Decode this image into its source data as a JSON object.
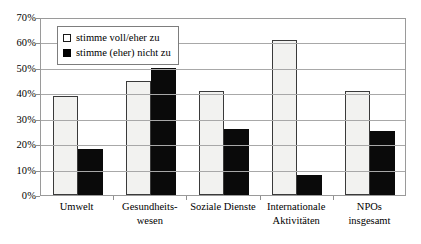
{
  "chart_data": {
    "type": "bar",
    "title": "",
    "subtitle": "",
    "xlabel": "",
    "ylabel": "",
    "ylim": [
      0,
      70
    ],
    "ytick_step": 10,
    "ytick_labels": [
      "0%",
      "10%",
      "20%",
      "30%",
      "40%",
      "50%",
      "60%",
      "70%"
    ],
    "grid": true,
    "legend_position": "top-left",
    "categories": [
      "Umwelt",
      "Gesundheits-wesen",
      "Soziale Dienste",
      "Internationale Aktivitäten",
      "NPOs insgesamt"
    ],
    "category_lines": [
      [
        "Umwelt"
      ],
      [
        "Gesundheits-",
        "wesen"
      ],
      [
        "Soziale Dienste"
      ],
      [
        "Internationale",
        "Aktivitäten"
      ],
      [
        "NPOs",
        "insgesamt"
      ]
    ],
    "series": [
      {
        "name": "stimme voll/eher zu",
        "color": "#f2f2f0",
        "values": [
          39,
          45,
          41,
          61,
          41
        ]
      },
      {
        "name": "stimme (eher) nicht zu",
        "color": "#0a0a0a",
        "values": [
          18,
          50,
          26,
          8,
          25
        ]
      }
    ]
  },
  "legend": {
    "items": [
      {
        "label": "stimme voll/eher zu",
        "swatch": "white-square-icon"
      },
      {
        "label": "stimme (eher) nicht zu",
        "swatch": "black-square-icon"
      }
    ]
  },
  "axis": {
    "y_ticks": [
      "70%",
      "60%",
      "50%",
      "40%",
      "30%",
      "20%",
      "10%",
      "0%"
    ]
  },
  "colors": {
    "series_light": "#f2f2f0",
    "series_dark": "#0a0a0a",
    "gridline": "#a8a8a8",
    "border": "#9a9a9a",
    "text": "#000000",
    "background": "#ffffff"
  }
}
